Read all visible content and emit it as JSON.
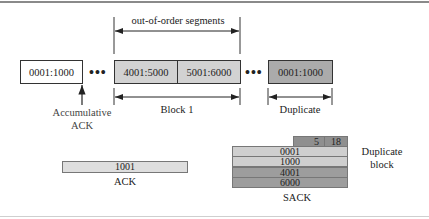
{
  "diagram": {
    "top_brace_label": "out-of-order segments",
    "segments": [
      {
        "label": "0001:1000",
        "fill": "#ffffff"
      },
      {
        "label": "4001:5000",
        "fill": "#d2d2d2"
      },
      {
        "label": "5001:6000",
        "fill": "#d2d2d2"
      },
      {
        "label": "0001:1000",
        "fill": "#ababab"
      }
    ],
    "ellipsis": "•••",
    "accumulative_label_line1": "Accumulative",
    "accumulative_label_line2": "ACK",
    "block1_label": "Block 1",
    "duplicate_label": "Duplicate",
    "ack": {
      "value": "1001",
      "caption": "ACK",
      "fill": "#dedede"
    },
    "sack": {
      "header": [
        "5",
        "18"
      ],
      "rows": [
        {
          "value": "0001",
          "fill": "#cfcfcf"
        },
        {
          "value": "1000",
          "fill": "#cfcfcf"
        },
        {
          "value": "4001",
          "fill": "#9d9d9d"
        },
        {
          "value": "6000",
          "fill": "#9d9d9d"
        }
      ],
      "header_fill": "#8f8f8f",
      "caption": "SACK",
      "side_label_line1": "Duplicate",
      "side_label_line2": "block"
    }
  }
}
